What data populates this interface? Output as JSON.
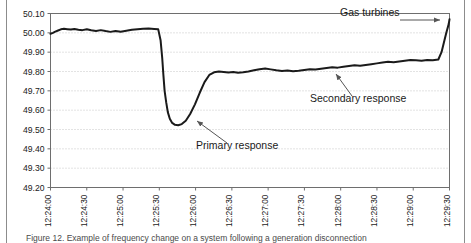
{
  "figure": {
    "caption": "Figure 12. Example of frequency change on a system following a generation disconnection"
  },
  "chart_data": {
    "type": "line",
    "title": "",
    "xlabel": "",
    "ylabel": "",
    "grid": true,
    "legend": "none",
    "ylim": [
      49.2,
      50.1
    ],
    "yticks": [
      "49.20",
      "49.30",
      "49.40",
      "49.50",
      "49.60",
      "49.70",
      "49.80",
      "49.90",
      "50.00",
      "50.10"
    ],
    "xticks": [
      "12:24:00",
      "12:24:30",
      "12:25:00",
      "12:25:30",
      "12:26:00",
      "12:26:30",
      "12:27:00",
      "12:27:30",
      "12:28:00",
      "12:28:30",
      "12:29:00",
      "12:29:30"
    ],
    "xlim": [
      "12:24:00",
      "12:29:30"
    ],
    "series": [
      {
        "name": "System frequency",
        "color": "#1a1a1a",
        "x": [
          0.0,
          0.6,
          1.2,
          1.9,
          2.6,
          3.4,
          4.2,
          5.1,
          6.0,
          7.0,
          8.0,
          9.1,
          10.2,
          11.4,
          12.6,
          13.8,
          15.0,
          16.3,
          17.6,
          19.0,
          20.4,
          21.8,
          23.2,
          24.6,
          26.0,
          27.0,
          27.6,
          28.0,
          28.3,
          28.6,
          29.0,
          29.4,
          29.9,
          30.5,
          31.2,
          32.0,
          32.9,
          33.9,
          35.0,
          36.2,
          37.4,
          38.6,
          39.8,
          41.0,
          42.2,
          43.4,
          44.6,
          45.8,
          47.0,
          48.3,
          49.6,
          51.0,
          52.4,
          53.8,
          55.2,
          56.6,
          58.0,
          59.4,
          60.8,
          62.2,
          63.6,
          65.0,
          66.4,
          67.8,
          69.2,
          70.6,
          72.0,
          73.4,
          74.8,
          76.2,
          77.6,
          79.0,
          80.4,
          81.8,
          83.2,
          84.6,
          86.0,
          87.4,
          88.8,
          90.2,
          91.6,
          93.0,
          94.4,
          95.8,
          97.2,
          98.0,
          98.6,
          99.2,
          99.8,
          100.0
        ],
        "y": [
          49.995,
          50.0,
          50.006,
          50.012,
          50.018,
          50.021,
          50.019,
          50.017,
          50.02,
          50.016,
          50.014,
          50.018,
          50.013,
          50.01,
          50.014,
          50.009,
          50.005,
          50.01,
          50.006,
          50.011,
          50.016,
          50.019,
          50.021,
          50.022,
          50.02,
          50.018,
          49.96,
          49.87,
          49.78,
          49.7,
          49.64,
          49.59,
          49.556,
          49.534,
          49.524,
          49.522,
          49.528,
          49.545,
          49.58,
          49.63,
          49.69,
          49.745,
          49.782,
          49.796,
          49.8,
          49.798,
          49.795,
          49.797,
          49.793,
          49.796,
          49.8,
          49.806,
          49.812,
          49.815,
          49.811,
          49.806,
          49.803,
          49.805,
          49.801,
          49.804,
          49.808,
          49.812,
          49.81,
          49.814,
          49.818,
          49.822,
          49.82,
          49.824,
          49.828,
          49.832,
          49.83,
          49.834,
          49.838,
          49.842,
          49.846,
          49.85,
          49.848,
          49.852,
          49.856,
          49.86,
          49.858,
          49.856,
          49.86,
          49.858,
          49.862,
          49.9,
          49.95,
          50.0,
          50.045,
          50.07
        ]
      }
    ],
    "annotations": [
      {
        "id": "gas-turbines",
        "label": "Gas turbines",
        "text_x": 340,
        "text_y": 16,
        "arrow_from_x": 400,
        "arrow_from_y": 20,
        "arrow_to_x": 440,
        "arrow_to_y": 20
      },
      {
        "id": "secondary-response",
        "label": "Secondary response",
        "text_x": 310,
        "text_y": 102,
        "arrow_from_x": 352,
        "arrow_from_y": 96,
        "arrow_to_x": 336,
        "arrow_to_y": 74
      },
      {
        "id": "primary-response",
        "label": "Primary response",
        "text_x": 196,
        "text_y": 149,
        "arrow_from_x": 227,
        "arrow_from_y": 143,
        "arrow_to_x": 197,
        "arrow_to_y": 121
      }
    ]
  }
}
